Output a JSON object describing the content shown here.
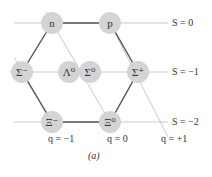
{
  "diagram": {
    "caption": "(a)",
    "nodes": [
      {
        "id": "n",
        "label": "n",
        "x": 52,
        "y": 23
      },
      {
        "id": "p",
        "label": "p",
        "x": 110,
        "y": 23
      },
      {
        "id": "sigma_minus",
        "label": "Σ⁻",
        "x": 22,
        "y": 72
      },
      {
        "id": "lambda0",
        "label": "Λ⁰",
        "x": 69,
        "y": 72
      },
      {
        "id": "sigma0",
        "label": "Σ⁰",
        "x": 90,
        "y": 72
      },
      {
        "id": "sigma_plus",
        "label": "Σ⁺",
        "x": 138,
        "y": 72
      },
      {
        "id": "xi_minus",
        "label": "Ξ⁻",
        "x": 52,
        "y": 122
      },
      {
        "id": "xi0",
        "label": "Ξ⁰",
        "x": 110,
        "y": 122
      }
    ],
    "strangeness_labels": [
      {
        "text": "S = 0",
        "x": 172,
        "y": 17
      },
      {
        "text": "S = −1",
        "x": 172,
        "y": 66
      },
      {
        "text": "S = −2",
        "x": 172,
        "y": 116
      }
    ],
    "charge_labels": [
      {
        "text": "q = −1",
        "x": 44,
        "y": 139
      },
      {
        "text": "q = 0",
        "x": 106,
        "y": 139
      },
      {
        "text": "q = +1",
        "x": 160,
        "y": 139
      }
    ],
    "colors": {
      "node": "#d4d4d4",
      "hexagon": "#555555",
      "grid": "#bbbbbb"
    }
  }
}
